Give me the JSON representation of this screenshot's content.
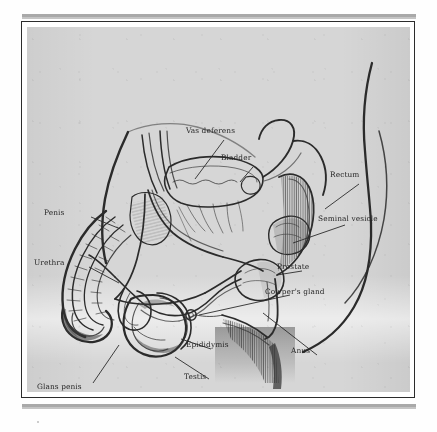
{
  "figure": {
    "type": "anatomical-diagram",
    "style": "scanned textbook line drawing",
    "paper_color": "#d6d6d6",
    "ink_color": "#262626",
    "rule_color": "#a9a9a9"
  },
  "labels": [
    {
      "id": "vas-deferens",
      "text": "Vas deferens",
      "x": 186,
      "y": 104
    },
    {
      "id": "bladder",
      "text": "Bladder",
      "x": 221,
      "y": 131
    },
    {
      "id": "rectum",
      "text": "Rectum",
      "x": 330,
      "y": 148
    },
    {
      "id": "seminal-vesicle",
      "text": "Seminal vesicle",
      "x": 318,
      "y": 192
    },
    {
      "id": "penis",
      "text": "Penis",
      "x": 44,
      "y": 186
    },
    {
      "id": "urethra",
      "text": "Urethra",
      "x": 34,
      "y": 236
    },
    {
      "id": "prostate",
      "text": "Prostate",
      "x": 277,
      "y": 240
    },
    {
      "id": "cowpers-gland",
      "text": "Cowper's gland",
      "x": 265,
      "y": 265
    },
    {
      "id": "epididymis",
      "text": "Epididymis",
      "x": 186,
      "y": 318
    },
    {
      "id": "anus",
      "text": "Anus",
      "x": 291,
      "y": 324
    },
    {
      "id": "testis",
      "text": "Testis",
      "x": 184,
      "y": 350
    },
    {
      "id": "glans-penis",
      "text": "Glans penis",
      "x": 37,
      "y": 360
    }
  ],
  "structures": [
    "body-contour",
    "bladder",
    "vas-deferens",
    "urethra",
    "penis-shaft",
    "glans-penis",
    "testis",
    "epididymis",
    "scrotum",
    "prostate",
    "cowpers-gland",
    "seminal-vesicle",
    "rectum",
    "anus",
    "pubic-hair-shading"
  ]
}
